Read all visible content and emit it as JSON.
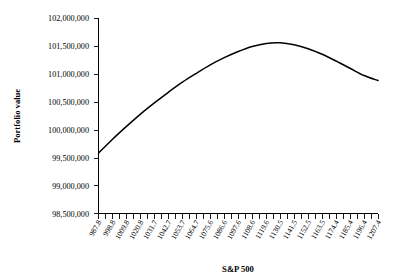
{
  "chart_data": {
    "type": "line",
    "title": "",
    "subtitle": "",
    "xlabel": "S&P 500",
    "ylabel": "Portfolio value",
    "grid": false,
    "legend": false,
    "legend_position": "none",
    "series_color": "#000000",
    "background_color": "#FFFFFF",
    "ylim": [
      98500000,
      102000000
    ],
    "ytick_labels": [
      "102,000,000",
      "101,500,000",
      "101,000,000",
      "100,500,000",
      "100,000,000",
      "99,500,000",
      "99,000,000",
      "98,500,000"
    ],
    "ytick_values": [
      102000000,
      101500000,
      101000000,
      100500000,
      100000000,
      99500000,
      99000000,
      98500000
    ],
    "xtick_labels": [
      "987.8",
      "998.8",
      "1009.8",
      "1020.8",
      "1031.7",
      "1042.7",
      "1053.7",
      "1064.7",
      "1075.6",
      "1086.6",
      "1097.6",
      "1108.6",
      "1119.6",
      "1130.5",
      "1141.5",
      "1152.5",
      "1163.5",
      "1174.4",
      "1185.4",
      "1196.4",
      "1207.4"
    ],
    "x": [
      987.8,
      998.8,
      1009.8,
      1020.8,
      1031.7,
      1042.7,
      1053.7,
      1064.7,
      1075.6,
      1086.6,
      1097.6,
      1108.6,
      1119.6,
      1130.5,
      1141.5,
      1152.5,
      1163.5,
      1174.4,
      1185.4,
      1196.4,
      1207.4
    ],
    "values": [
      99580000,
      99830000,
      100060000,
      100280000,
      100480000,
      100670000,
      100850000,
      101010000,
      101160000,
      101290000,
      101400000,
      101490000,
      101545000,
      101555000,
      101520000,
      101450000,
      101350000,
      101230000,
      101100000,
      100970000,
      100880000
    ],
    "minor_tick_count": 41,
    "label_every_nth_tick": 2
  }
}
